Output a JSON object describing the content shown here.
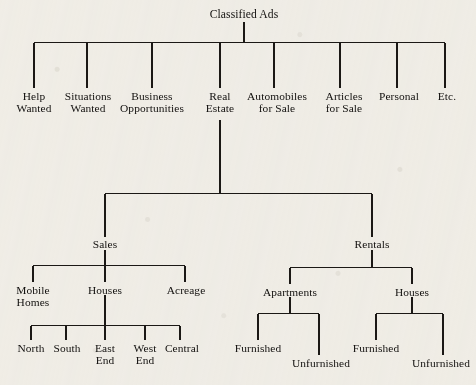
{
  "diagram": {
    "type": "hierarchy-tree",
    "title": "Classified Ads",
    "background_color": "#f3f1ec",
    "line_color": "#1b1815",
    "text_color": "#12100e",
    "levels": 4,
    "root": {
      "label": "Classified Ads",
      "children": [
        {
          "label": "Help\nWanted"
        },
        {
          "label": "Situations\nWanted"
        },
        {
          "label": "Business\nOpportunities"
        },
        {
          "label": "Real\nEstate",
          "children": [
            {
              "label": "Sales",
              "children": [
                {
                  "label": "Mobile\nHomes"
                },
                {
                  "label": "Houses",
                  "children": [
                    {
                      "label": "North"
                    },
                    {
                      "label": "South"
                    },
                    {
                      "label": "East\nEnd"
                    },
                    {
                      "label": "West\nEnd"
                    },
                    {
                      "label": "Central"
                    }
                  ]
                },
                {
                  "label": "Acreage"
                }
              ]
            },
            {
              "label": "Rentals",
              "children": [
                {
                  "label": "Apartments",
                  "children": [
                    {
                      "label": "Furnished"
                    },
                    {
                      "label": "Unfurnished"
                    }
                  ]
                },
                {
                  "label": "Houses",
                  "children": [
                    {
                      "label": "Furnished"
                    },
                    {
                      "label": "Unfurnished"
                    }
                  ]
                }
              ]
            }
          ]
        },
        {
          "label": "Automobiles\nfor Sale"
        },
        {
          "label": "Articles\nfor Sale"
        },
        {
          "label": "Personal"
        },
        {
          "label": "Etc."
        }
      ]
    },
    "nodes": {
      "root": "Classified Ads",
      "help_wanted": "Help\nWanted",
      "situations_wanted": "Situations\nWanted",
      "business_opportunities": "Business\nOpportunities",
      "real_estate": "Real\nEstate",
      "automobiles_for_sale": "Automobiles\nfor Sale",
      "articles_for_sale": "Articles\nfor Sale",
      "personal": "Personal",
      "etc": "Etc.",
      "sales": "Sales",
      "rentals": "Rentals",
      "mobile_homes": "Mobile\nHomes",
      "sales_houses": "Houses",
      "acreage": "Acreage",
      "north": "North",
      "south": "South",
      "east_end": "East\nEnd",
      "west_end": "West\nEnd",
      "central": "Central",
      "apartments": "Apartments",
      "rentals_houses": "Houses",
      "apartments_furnished": "Furnished",
      "apartments_unfurnished": "Unfurnished",
      "rental_houses_furnished": "Furnished",
      "rental_houses_unfurnished": "Unfurnished"
    }
  }
}
